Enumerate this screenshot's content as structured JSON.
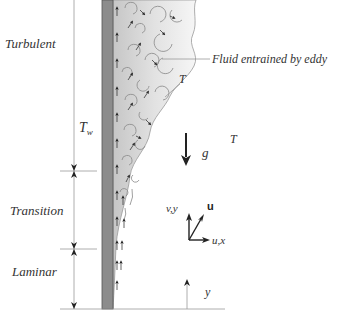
{
  "figure": {
    "regions": [
      {
        "label": "Turbulent",
        "y_top": 0,
        "y_bottom": 171
      },
      {
        "label": "Transition",
        "y_top": 171,
        "y_bottom": 249
      },
      {
        "label": "Laminar",
        "y_top": 249,
        "y_bottom": 309
      }
    ],
    "labels": {
      "wall_temperature": "T",
      "wall_temperature_sub": "w",
      "eddy_annotation": "Fluid entrained by eddy",
      "local_temperature": "T",
      "ambient_temperature": "T",
      "gravity": "g",
      "axis_vertical": "v,y",
      "velocity_vector": "u",
      "axis_horizontal": "u,x",
      "height_coordinate": "y"
    },
    "colors": {
      "wall": "#8c8c8c",
      "wall_edge": "#555555",
      "boundary_layer_light": "#f3f3f3",
      "boundary_layer_dark": "#c8c8c8",
      "lines": "#999999",
      "arrows": "#222222"
    }
  }
}
